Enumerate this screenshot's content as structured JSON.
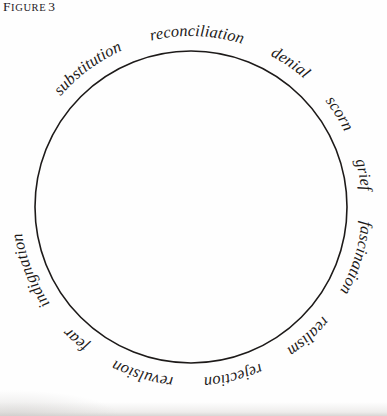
{
  "figure": {
    "caption_label_first": "F",
    "caption_label_rest": "IGURE",
    "caption_number": "3",
    "caption_full": "FIGURE 3"
  },
  "diagram": {
    "type": "word-circle",
    "shape": "circle",
    "stroke_color": "#1d1a19",
    "text_color": "#1d1a19",
    "background_color": "#fefefe",
    "center_x": 191,
    "center_y": 207,
    "radius": 156,
    "word_count": 12,
    "reading_direction": "clockwise",
    "text_placement": "outside-ring",
    "words": [
      {
        "index": 0,
        "text": "substitution",
        "angle_deg": 330
      },
      {
        "index": 1,
        "text": "reconciliation",
        "angle_deg": 10
      },
      {
        "index": 2,
        "text": "denial",
        "angle_deg": 48
      },
      {
        "index": 3,
        "text": "scorn",
        "angle_deg": 68
      },
      {
        "index": 4,
        "text": "grief",
        "angle_deg": 85
      },
      {
        "index": 5,
        "text": "fascination",
        "angle_deg": 110
      },
      {
        "index": 6,
        "text": "realism",
        "angle_deg": 141
      },
      {
        "index": 7,
        "text": "rejection",
        "angle_deg": 163
      },
      {
        "index": 8,
        "text": "revulsion",
        "angle_deg": 192
      },
      {
        "index": 9,
        "text": "fear",
        "angle_deg": 214
      },
      {
        "index": 10,
        "text": "indignation",
        "angle_deg": 240
      },
      {
        "index": 11,
        "text": "aspiration",
        "angle_deg": 278
      }
    ],
    "ring_sequence": "substitution reconciliation denial scorn grief fascination realism rejection revulsion fear indignation aspiration"
  }
}
